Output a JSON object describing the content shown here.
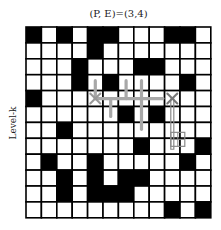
{
  "title": "(P, E)=(3,4)",
  "ylabel": "Level-k",
  "grid": {
    "rows": 12,
    "cols": 12,
    "cells": [
      [
        1,
        0,
        1,
        0,
        1,
        1,
        0,
        0,
        0,
        1,
        1,
        0
      ],
      [
        0,
        0,
        0,
        0,
        1,
        0,
        0,
        0,
        0,
        0,
        0,
        0
      ],
      [
        0,
        0,
        0,
        1,
        0,
        0,
        0,
        1,
        1,
        0,
        0,
        0
      ],
      [
        0,
        0,
        0,
        1,
        0,
        1,
        0,
        0,
        0,
        0,
        1,
        0
      ],
      [
        1,
        0,
        0,
        0,
        0,
        0,
        0,
        0,
        0,
        0,
        0,
        0
      ],
      [
        0,
        0,
        0,
        0,
        0,
        0,
        1,
        0,
        1,
        0,
        0,
        0
      ],
      [
        0,
        0,
        1,
        0,
        0,
        0,
        0,
        0,
        0,
        0,
        0,
        0
      ],
      [
        0,
        0,
        0,
        0,
        0,
        0,
        0,
        1,
        0,
        0,
        0,
        1
      ],
      [
        0,
        1,
        0,
        0,
        1,
        0,
        0,
        0,
        0,
        0,
        1,
        0
      ],
      [
        0,
        0,
        1,
        0,
        1,
        0,
        1,
        1,
        0,
        0,
        0,
        0
      ],
      [
        0,
        0,
        1,
        0,
        1,
        1,
        1,
        0,
        0,
        0,
        0,
        0
      ],
      [
        0,
        0,
        0,
        0,
        0,
        0,
        0,
        0,
        0,
        1,
        0,
        1
      ]
    ]
  },
  "markers": [
    {
      "type": "x",
      "row": 4,
      "col": 4,
      "color": "#999999"
    },
    {
      "type": "x",
      "row": 4,
      "col": 9,
      "color": "#777777"
    }
  ],
  "colors": {
    "path_thick": "#a8a8a8",
    "path_outline": "#8a8a8a",
    "cell_fill": "#000000"
  }
}
